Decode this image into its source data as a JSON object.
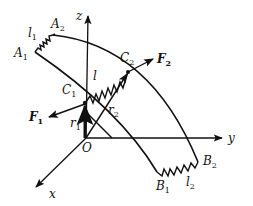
{
  "figure": {
    "axes": {
      "x": "x",
      "y": "y",
      "z": "z",
      "origin": "O"
    },
    "points": {
      "A1": {
        "base": "A",
        "sub": "1"
      },
      "A2": {
        "base": "A",
        "sub": "2"
      },
      "B1": {
        "base": "B",
        "sub": "1"
      },
      "B2": {
        "base": "B",
        "sub": "2"
      },
      "C1": {
        "base": "C",
        "sub": "1"
      },
      "C2": {
        "base": "C",
        "sub": "2"
      }
    },
    "springs": {
      "l1": {
        "base": "l",
        "sub": "1"
      },
      "l2": {
        "base": "l",
        "sub": "2"
      },
      "l": {
        "base": "l",
        "sub": ""
      }
    },
    "vectors": {
      "r1": {
        "base": "r",
        "sub": "1"
      },
      "r2": {
        "base": "r",
        "sub": "2"
      }
    },
    "forces": {
      "F1": {
        "base": "F",
        "sub": "1"
      },
      "F2": {
        "base": "F",
        "sub": "2"
      }
    },
    "colors": {
      "stroke": "#111111",
      "background": "#ffffff"
    }
  }
}
